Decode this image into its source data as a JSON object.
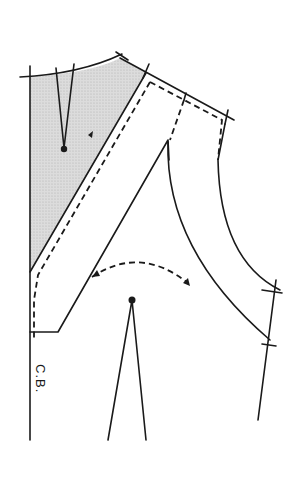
{
  "diagram": {
    "type": "sewing-pattern",
    "labels": {
      "center_back": "C.B."
    },
    "colors": {
      "line": "#1a1a1a",
      "shade": "#d4d4d4",
      "background": "#ffffff"
    }
  }
}
